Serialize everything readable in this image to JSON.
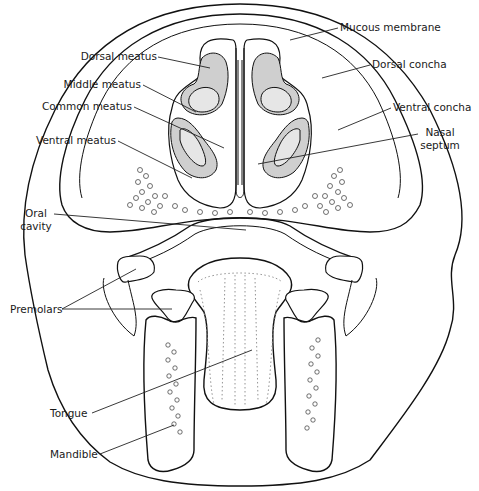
{
  "figure": {
    "labels": {
      "mucous_membrane": "Mucous membrane",
      "dorsal_meatus": "Dorsal meatus",
      "dorsal_concha": "Dorsal concha",
      "middle_meatus": "Middle meatus",
      "common_meatus": "Common meatus",
      "ventral_concha": "Ventral concha",
      "ventral_meatus": "Ventral meatus",
      "nasal_septum_line1": "Nasal",
      "nasal_septum_line2": "septum",
      "oral_cavity_line1": "Oral",
      "oral_cavity_line2": "cavity",
      "premolars": "Premolars",
      "tongue": "Tongue",
      "mandible": "Mandible"
    },
    "colors": {
      "line": "#111111",
      "background": "#ffffff",
      "stipple": "#cfcfcf"
    }
  }
}
